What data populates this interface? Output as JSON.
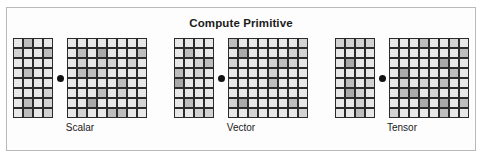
{
  "figure": {
    "title": "Compute Primitive",
    "border_color": "#b9b9b9",
    "background_color": "#ffffff",
    "cell_border_color": "#2b2b2b",
    "cell_fill_color": "#e8e8e8",
    "dot_color": "#111111"
  },
  "groups": [
    {
      "label": "Scalar",
      "left_grid": {
        "cols": 4,
        "rows": 8,
        "count": 32
      },
      "separator": "dot",
      "right_grid": {
        "cols": 8,
        "rows": 8,
        "count": 64
      }
    },
    {
      "label": "Vector",
      "left_grid": {
        "cols": 4,
        "rows": 8,
        "count": 32
      },
      "separator": "dot",
      "right_grid": {
        "cols": 8,
        "rows": 8,
        "count": 64
      }
    },
    {
      "label": "Tensor",
      "left_grid": {
        "cols": 4,
        "rows": 8,
        "count": 32
      },
      "separator": "dot",
      "right_grid": {
        "cols": 8,
        "rows": 8,
        "count": 64
      }
    }
  ],
  "chart_data": {
    "type": "diagram",
    "title": "Compute Primitive",
    "categories": [
      "Scalar",
      "Vector",
      "Tensor"
    ],
    "series": [
      {
        "name": "left block cells",
        "values": [
          32,
          32,
          32
        ]
      },
      {
        "name": "right block cells",
        "values": [
          64,
          64,
          64
        ]
      }
    ],
    "legend": "none",
    "grid": false
  }
}
